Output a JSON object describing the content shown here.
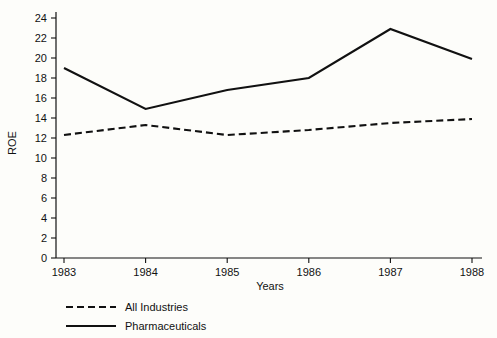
{
  "chart_data": {
    "type": "line",
    "title": "",
    "xlabel": "Years",
    "ylabel": "ROE",
    "x": [
      "1983",
      "1984",
      "1985",
      "1986",
      "1987",
      "1988"
    ],
    "categories": [
      "1983",
      "1984",
      "1985",
      "1986",
      "1987",
      "1988"
    ],
    "xtick_labels": [
      "1983",
      "1984",
      "1985",
      "1986",
      "1987",
      "1988"
    ],
    "ytick_labels": [
      "0",
      "2",
      "4",
      "6",
      "8",
      "10",
      "12",
      "14",
      "16",
      "18",
      "20",
      "22",
      "24"
    ],
    "yticks": [
      0,
      2,
      4,
      6,
      8,
      10,
      12,
      14,
      16,
      18,
      20,
      22,
      24
    ],
    "ylim": [
      0,
      24
    ],
    "grid": false,
    "legend_position": "bottom-left",
    "series": [
      {
        "name": "All Industries",
        "style": "dashed",
        "color": "#111111",
        "values": [
          12.3,
          13.3,
          12.3,
          12.8,
          13.5,
          13.9
        ]
      },
      {
        "name": "Pharmaceuticals",
        "style": "solid",
        "color": "#111111",
        "values": [
          19.0,
          14.9,
          16.8,
          18.0,
          22.9,
          19.9
        ]
      }
    ]
  },
  "axes": {
    "y_title": "ROE",
    "x_title": "Years"
  },
  "legend": {
    "entries": [
      {
        "label": "All Industries",
        "style": "dashed"
      },
      {
        "label": "Pharmaceuticals",
        "style": "solid"
      }
    ]
  },
  "colors": {
    "ink": "#111111",
    "background": "#fdfdfa"
  }
}
